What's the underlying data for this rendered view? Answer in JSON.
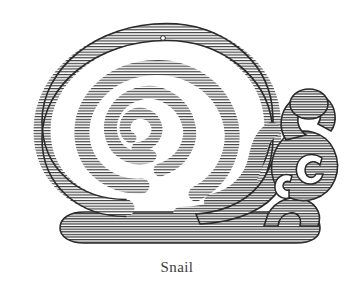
{
  "figure": {
    "caption": "Snail",
    "subject": "snail",
    "style": "koru spiral line art with horizontal hatching",
    "background_color": "#ffffff",
    "ink_color": "#2b2b2b",
    "hatch_color": "#3a3a3a",
    "caption_color": "#3b3b3b"
  },
  "artwork": {
    "title": "Snail",
    "parts": [
      {
        "name": "shell-outer-whorl",
        "label": "Shell outer whorl"
      },
      {
        "name": "shell-inner-whorl",
        "label": "Shell inner whorl"
      },
      {
        "name": "shell-spiral-core",
        "label": "Spiral core"
      },
      {
        "name": "shell-aperture-dot",
        "label": "Small dot on shell rim"
      },
      {
        "name": "body-band",
        "label": "Body band"
      },
      {
        "name": "neck-chevron",
        "label": "Neck chevron"
      },
      {
        "name": "eye-stalk",
        "label": "Eye stalk tentacle"
      },
      {
        "name": "eye-stalk-tip",
        "label": "Bulbous tentacle tip"
      },
      {
        "name": "head-koru",
        "label": "Head koru spiral"
      },
      {
        "name": "head-koru-inner",
        "label": "Inner head curl"
      },
      {
        "name": "foot",
        "label": "Foot"
      },
      {
        "name": "tail-curl",
        "label": "Tail curl"
      }
    ]
  }
}
